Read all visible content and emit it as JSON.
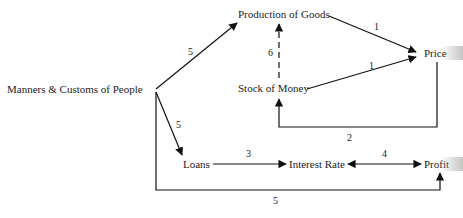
{
  "diagram": {
    "nodes": {
      "manners": "Manners & Customs of People",
      "production": "Production of Goods",
      "stock": "Stock of Money",
      "price": "Price",
      "loans": "Loans",
      "interest": "Interest Rate",
      "profit": "Profit"
    },
    "edges": [
      {
        "from": "manners",
        "to": "production",
        "label": "5"
      },
      {
        "from": "manners",
        "to": "loans",
        "label": "5"
      },
      {
        "from": "manners",
        "to": "profit",
        "label": "5"
      },
      {
        "from": "production",
        "to": "price",
        "label": "1"
      },
      {
        "from": "stock",
        "to": "price",
        "label": "1"
      },
      {
        "from": "stock",
        "to": "production",
        "label": "6",
        "style": "dashed"
      },
      {
        "from": "price",
        "to": "stock",
        "label": "2"
      },
      {
        "from": "loans",
        "to": "interest",
        "label": "3"
      },
      {
        "from": "interest",
        "to": "profit",
        "label": "4",
        "style": "bidirectional"
      }
    ],
    "colors": {
      "line": "#111111",
      "text": "#222222",
      "background": "#ffffff"
    }
  }
}
